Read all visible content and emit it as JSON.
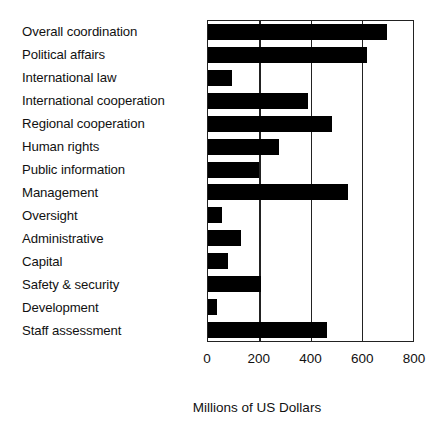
{
  "chart_data": {
    "type": "bar",
    "orientation": "horizontal",
    "title": "",
    "subtitle": "",
    "xlabel": "Millions of US Dollars",
    "ylabel": "",
    "xlim": [
      0,
      800
    ],
    "xticks": [
      0,
      200,
      400,
      600,
      800
    ],
    "xtick_labels": [
      "0",
      "200",
      "400",
      "600",
      "800"
    ],
    "grid": true,
    "grid_axis": "x",
    "legend": null,
    "legend_position": "none",
    "bar_color": "#000000",
    "axis_color": "#222222",
    "categories": [
      "Overall coordination",
      "Political affairs",
      "International law",
      "International cooperation",
      "Regional cooperation",
      "Human rights",
      "Public information",
      "Management",
      "Oversight",
      "Administrative",
      "Capital",
      "Safety & security",
      "Development",
      "Staff assessment"
    ],
    "values": [
      700,
      620,
      95,
      390,
      485,
      278,
      200,
      545,
      55,
      128,
      78,
      208,
      35,
      465
    ]
  }
}
